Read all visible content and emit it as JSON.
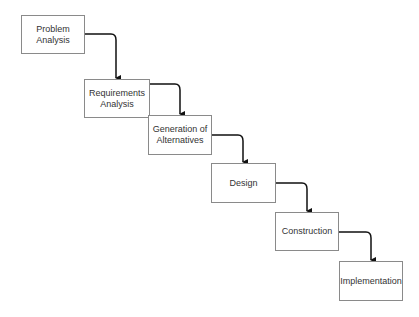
{
  "diagram": {
    "type": "waterfall-process",
    "steps": [
      {
        "label": "Problem\nAnalysis",
        "x": 21,
        "y": 15,
        "w": 64,
        "h": 39
      },
      {
        "label": "Requirements\nAnalysis",
        "x": 84,
        "y": 79,
        "w": 66,
        "h": 39
      },
      {
        "label": "Generation of\nAlternatives",
        "x": 148,
        "y": 115,
        "w": 64,
        "h": 40
      },
      {
        "label": "Design",
        "x": 211,
        "y": 163,
        "w": 65,
        "h": 40
      },
      {
        "label": "Construction",
        "x": 275,
        "y": 212,
        "w": 64,
        "h": 39
      },
      {
        "label": "Implementation",
        "x": 339,
        "y": 261,
        "w": 64,
        "h": 40
      }
    ],
    "colors": {
      "border": "#8a8a8a",
      "arrow": "#111111",
      "text": "#333333"
    }
  }
}
